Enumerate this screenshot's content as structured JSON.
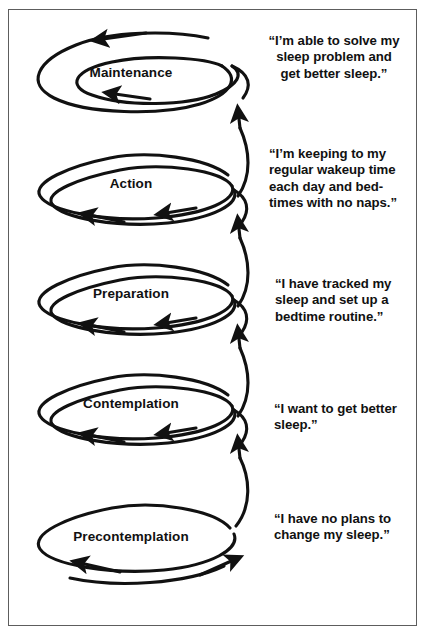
{
  "figure": {
    "background_color": "#ffffff",
    "ink_color": "#111111",
    "border_color": "#5d5d5d"
  },
  "stages": [
    {
      "id": "maintenance",
      "label": "Maintenance",
      "order": 5,
      "loop_type": "double-coil",
      "quote": "“I’m able to solve my sleep problem and get better sleep.”",
      "quote_lines": [
        "“I’m able to solve my",
        "sleep problem and",
        "get better sleep.”"
      ],
      "quote_align": "center"
    },
    {
      "id": "action",
      "label": "Action",
      "order": 4,
      "loop_type": "double-coil",
      "quote": "“I’m keeping to my regular wakeup time each day and bedtimes with no naps.”",
      "quote_lines": [
        "“I’m keeping to my",
        "regular wakeup time",
        "each day and bed-",
        "times with no naps.”"
      ],
      "quote_align": "left"
    },
    {
      "id": "preparation",
      "label": "Preparation",
      "order": 3,
      "loop_type": "double-coil",
      "quote": "“I have tracked my sleep and set up a bedtime routine.”",
      "quote_lines": [
        "“I have tracked my",
        "sleep and set up a",
        "bedtime routine.”"
      ],
      "quote_align": "left"
    },
    {
      "id": "contemplation",
      "label": "Contemplation",
      "order": 2,
      "loop_type": "double-coil",
      "quote": "“I want to get better sleep.”",
      "quote_lines": [
        "“I want to get better",
        "sleep.”"
      ],
      "quote_align": "left"
    },
    {
      "id": "precontemplation",
      "label": "Precontemplation",
      "order": 1,
      "loop_type": "single-loop-with-tail",
      "quote": "“I have no plans to change my sleep.”",
      "quote_lines": [
        "“I have no plans to",
        "change my sleep.”"
      ],
      "quote_align": "left"
    }
  ]
}
